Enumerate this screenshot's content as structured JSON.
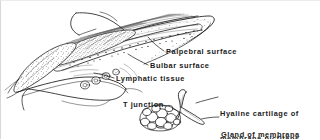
{
  "figure": {
    "ink_color": "#1a1a1a",
    "background_color": "#ffffff",
    "labels": [
      {
        "id": "palpebral",
        "text": "Palpebral surface"
      },
      {
        "id": "bulbar",
        "text": "Bulbar surface"
      },
      {
        "id": "lymphatic",
        "text": "Lymphatic tissue"
      },
      {
        "id": "tjunction",
        "text": "T junction"
      },
      {
        "id": "hyaline",
        "line1": "Hyaline cartilage of",
        "line2": "membrana nictitans"
      },
      {
        "id": "gland",
        "line1": "Gland of membrana",
        "line2": "nictitans"
      }
    ]
  }
}
